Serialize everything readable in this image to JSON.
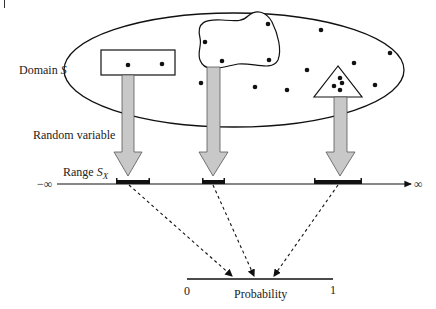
{
  "diagram": {
    "labels": {
      "domain_prefix": "Domain ",
      "domain_symbol": "S",
      "random_variable": "Random variable",
      "range_prefix": "Range ",
      "range_symbol": "S",
      "range_subscript": "X",
      "neg_infinity": "−∞",
      "pos_infinity": "∞",
      "probability": "Probability",
      "prob_zero": "0",
      "prob_one": "1"
    },
    "domain_shapes": [
      {
        "shape": "rectangle",
        "dots": 2
      },
      {
        "shape": "blob",
        "dots": 3
      },
      {
        "shape": "triangle",
        "dots": 4
      }
    ],
    "loose_dots_in_domain": 9,
    "range_segments": 3,
    "colors": {
      "stroke": "#111111",
      "arrow_fill": "#c8c8c8",
      "arrow_stroke": "#555555",
      "segment": "#111111"
    }
  }
}
